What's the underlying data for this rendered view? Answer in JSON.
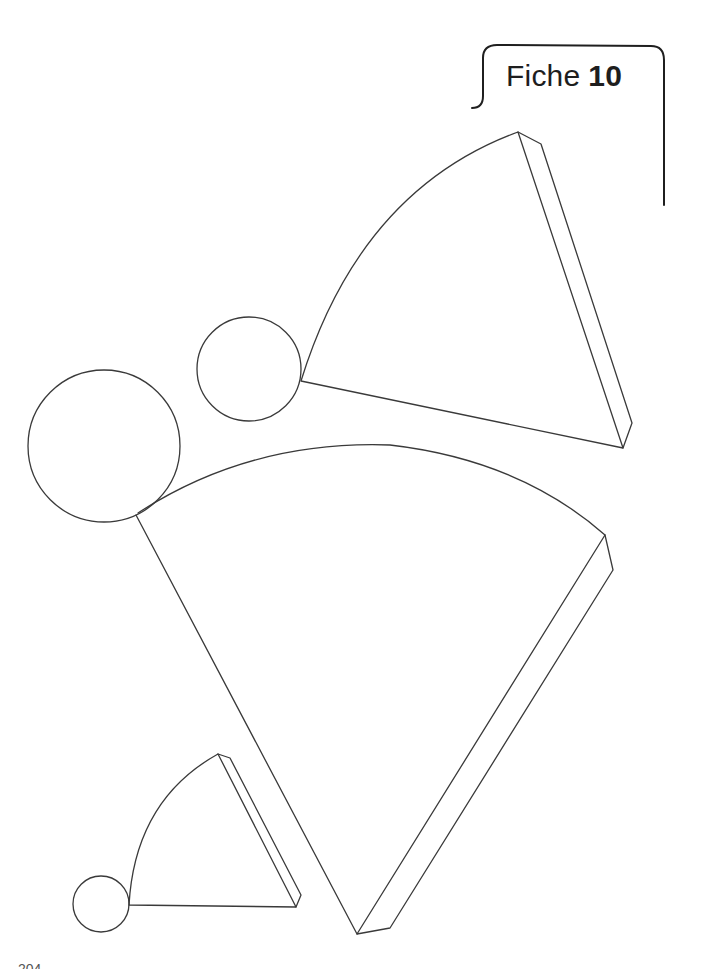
{
  "header": {
    "label_word": "Fiche",
    "label_number": "10"
  },
  "footer": {
    "page_number": "204"
  },
  "figures": {
    "description": "Patrons (nets) of three cones: each made of a circular base and a circular sector with a glue tab",
    "shapes": [
      {
        "name": "cone-net-medium",
        "base_circle": {
          "cx": 249,
          "cy": 369,
          "r": 52
        },
        "sector_apex": [
          623,
          448
        ]
      },
      {
        "name": "cone-net-large",
        "base_circle": {
          "cx": 104,
          "cy": 446,
          "r": 76
        },
        "sector_apex": [
          357,
          934
        ]
      },
      {
        "name": "cone-net-small",
        "base_circle": {
          "cx": 101,
          "cy": 904,
          "r": 28
        },
        "sector_apex": [
          296,
          907
        ]
      }
    ]
  },
  "colors": {
    "line": "#3a3a3a",
    "background": "#ffffff"
  }
}
